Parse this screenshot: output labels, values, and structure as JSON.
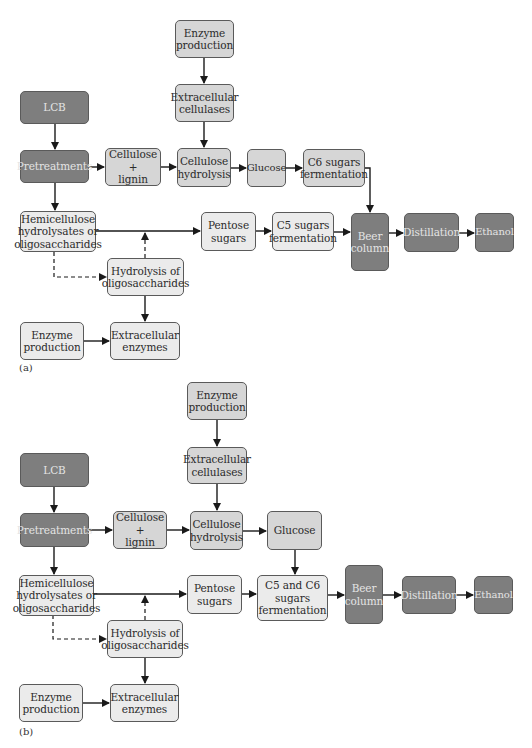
{
  "figure": {
    "panels": [
      {
        "label": "(a)",
        "nodes": {
          "enzyme_production_top": "Enzyme\nproduction",
          "extracellular_cellulases": "Extracellular\ncellulases",
          "lcb": "LCB",
          "pretreatments": "Pretreatments",
          "cellulose_lignin": "Cellulose +\nlignin",
          "cellulose_hydrolysis": "Cellulose\nhydrolysis",
          "glucose": "Glucose",
          "c6_fermentation": "C6 sugars\nfermentation",
          "hemicellulose": "Hemicellulose\nhydrolysates or\noligosaccharides",
          "pentose_sugars": "Pentose\nsugars",
          "c5_fermentation": "C5 sugars\nfermentation",
          "beer_column": "Beer\ncolumn",
          "distillation": "Distillation",
          "ethanol": "Ethanol",
          "hydrolysis_oligosaccharides": "Hydrolysis of\noligosaccharides",
          "enzyme_production_bottom": "Enzyme\nproduction",
          "extracellular_enzymes": "Extracellular\nenzymes"
        },
        "edges": [
          [
            "enzyme_production_top",
            "extracellular_cellulases",
            "solid"
          ],
          [
            "extracellular_cellulases",
            "cellulose_hydrolysis",
            "solid"
          ],
          [
            "lcb",
            "pretreatments",
            "solid"
          ],
          [
            "pretreatments",
            "cellulose_lignin",
            "solid"
          ],
          [
            "cellulose_lignin",
            "cellulose_hydrolysis",
            "solid"
          ],
          [
            "cellulose_hydrolysis",
            "glucose",
            "solid"
          ],
          [
            "glucose",
            "c6_fermentation",
            "solid"
          ],
          [
            "c6_fermentation",
            "beer_column",
            "solid"
          ],
          [
            "pretreatments",
            "hemicellulose",
            "solid"
          ],
          [
            "hemicellulose",
            "pentose_sugars",
            "solid"
          ],
          [
            "pentose_sugars",
            "c5_fermentation",
            "solid"
          ],
          [
            "c5_fermentation",
            "beer_column",
            "solid"
          ],
          [
            "beer_column",
            "distillation",
            "solid"
          ],
          [
            "distillation",
            "ethanol",
            "solid"
          ],
          [
            "hemicellulose",
            "hydrolysis_oligosaccharides",
            "dashed"
          ],
          [
            "hydrolysis_oligosaccharides",
            "hemicellulose-pentose line",
            "dashed"
          ],
          [
            "hydrolysis_oligosaccharides",
            "extracellular_enzymes",
            "solid"
          ],
          [
            "enzyme_production_bottom",
            "extracellular_enzymes",
            "solid"
          ]
        ]
      },
      {
        "label": "(b)",
        "nodes": {
          "enzyme_production_top": "Enzyme\nproduction",
          "extracellular_cellulases": "Extracellular\ncellulases",
          "lcb": "LCB",
          "pretreatments": "Pretreatments",
          "cellulose_lignin": "Cellulose +\nlignin",
          "cellulose_hydrolysis": "Cellulose\nhydrolysis",
          "glucose": "Glucose",
          "c5_c6_fermentation": "C5 and C6\nsugars\nfermentation",
          "hemicellulose": "Hemicellulose\nhydrolysates or\noligosaccharides",
          "pentose_sugars": "Pentose\nsugars",
          "beer_column": "Beer\ncolumn",
          "distillation": "Distillation",
          "ethanol": "Ethanol",
          "hydrolysis_oligosaccharides": "Hydrolysis of\noligosaccharides",
          "enzyme_production_bottom": "Enzyme\nproduction",
          "extracellular_enzymes": "Extracellular\nenzymes"
        },
        "edges": [
          [
            "enzyme_production_top",
            "extracellular_cellulases",
            "solid"
          ],
          [
            "extracellular_cellulases",
            "cellulose_hydrolysis",
            "solid"
          ],
          [
            "lcb",
            "pretreatments",
            "solid"
          ],
          [
            "pretreatments",
            "cellulose_lignin",
            "solid"
          ],
          [
            "cellulose_lignin",
            "cellulose_hydrolysis",
            "solid"
          ],
          [
            "cellulose_hydrolysis",
            "glucose",
            "solid"
          ],
          [
            "glucose",
            "c5_c6_fermentation",
            "solid"
          ],
          [
            "pretreatments",
            "hemicellulose",
            "solid"
          ],
          [
            "hemicellulose",
            "pentose_sugars",
            "solid"
          ],
          [
            "pentose_sugars",
            "c5_c6_fermentation",
            "solid"
          ],
          [
            "c5_c6_fermentation",
            "beer_column",
            "solid"
          ],
          [
            "beer_column",
            "distillation",
            "solid"
          ],
          [
            "distillation",
            "ethanol",
            "solid"
          ],
          [
            "hemicellulose",
            "hydrolysis_oligosaccharides",
            "dashed"
          ],
          [
            "hydrolysis_oligosaccharides",
            "hemicellulose-pentose line",
            "dashed"
          ],
          [
            "hydrolysis_oligosaccharides",
            "extracellular_enzymes",
            "solid"
          ],
          [
            "enzyme_production_bottom",
            "extracellular_enzymes",
            "solid"
          ]
        ]
      }
    ],
    "colors": {
      "dark_box": "#7e7e7e",
      "mid_box": "#d6d6d6",
      "light_box": "#ebebeb",
      "line": "#1a1a1a"
    }
  }
}
